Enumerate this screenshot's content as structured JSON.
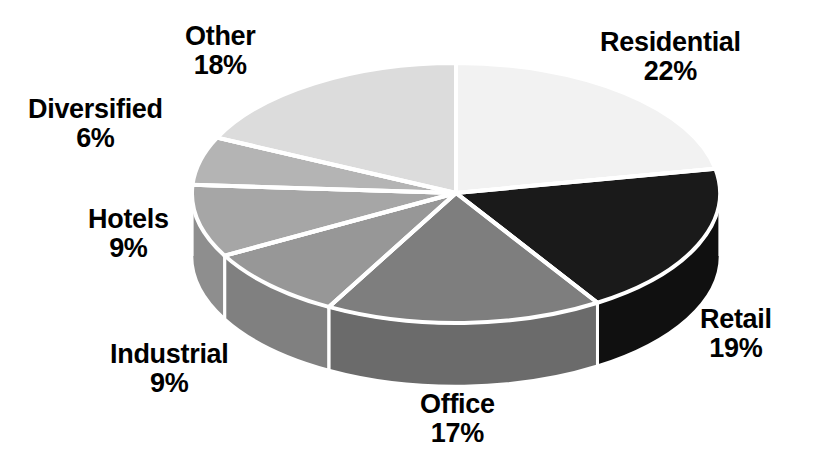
{
  "chart_data": {
    "type": "pie",
    "title": "",
    "subtitle": "",
    "xlabel": "",
    "ylabel": "",
    "legend_position": "none",
    "grid": false,
    "value_suffix": "%",
    "three_d": true,
    "start_angle_deg": 0,
    "direction": "clockwise",
    "categories": [
      "Residential",
      "Retail",
      "Office",
      "Industrial",
      "Hotels",
      "Diversified",
      "Other"
    ],
    "values": [
      22,
      19,
      17,
      9,
      9,
      6,
      18
    ],
    "slices": [
      {
        "name": "Residential",
        "value": 22,
        "value_text": "22%",
        "top_color": "#f2f2f2",
        "side_color": "#d2d2d2",
        "label_x": 600,
        "label_y": 28
      },
      {
        "name": "Retail",
        "value": 19,
        "value_text": "19%",
        "top_color": "#1a1a1a",
        "side_color": "#101010",
        "label_x": 700,
        "label_y": 305
      },
      {
        "name": "Office",
        "value": 17,
        "value_text": "17%",
        "top_color": "#7e7e7e",
        "side_color": "#6b6b6b",
        "label_x": 420,
        "label_y": 390
      },
      {
        "name": "Industrial",
        "value": 9,
        "value_text": "9%",
        "top_color": "#979797",
        "side_color": "#808080",
        "label_x": 110,
        "label_y": 340
      },
      {
        "name": "Hotels",
        "value": 9,
        "value_text": "9%",
        "top_color": "#a6a6a6",
        "side_color": "#8e8e8e",
        "label_x": 88,
        "label_y": 205
      },
      {
        "name": "Diversified",
        "value": 6,
        "value_text": "6%",
        "top_color": "#b4b4b4",
        "side_color": "#9c9c9c",
        "label_x": 28,
        "label_y": 95
      },
      {
        "name": "Other",
        "value": 18,
        "value_text": "18%",
        "top_color": "#dcdcdc",
        "side_color": "#c0c0c0",
        "label_x": 185,
        "label_y": 22
      }
    ],
    "geometry": {
      "center_x": 456,
      "center_y": 193,
      "radius_x": 264,
      "radius_y": 130,
      "depth": 63
    },
    "style": {
      "separator_color": "#ffffff",
      "separator_width": 4,
      "background": "#ffffff",
      "label_color": "#000000"
    }
  }
}
